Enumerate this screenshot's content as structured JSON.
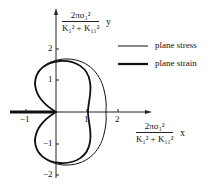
{
  "diagram": {
    "type": "polar plot of crack-tip plastic zone boundary",
    "y_axis": {
      "label_numerator": "2πσ₁²",
      "label_denominator": "K₁² + K₁₁²",
      "variable": "y",
      "ticks": [
        "2",
        "1",
        "−1",
        "−2"
      ]
    },
    "x_axis": {
      "label_numerator": "2πσ₁²",
      "label_denominator": "K₁² + K₁₁²",
      "variable": "x",
      "ticks": [
        "−1",
        "1",
        "2"
      ]
    },
    "legend": [
      {
        "label": "plane stress",
        "style": "thin"
      },
      {
        "label": "plane strain",
        "style": "thick"
      }
    ],
    "colors": {
      "line": "#1a1a1a",
      "background": "#ffffff"
    }
  }
}
